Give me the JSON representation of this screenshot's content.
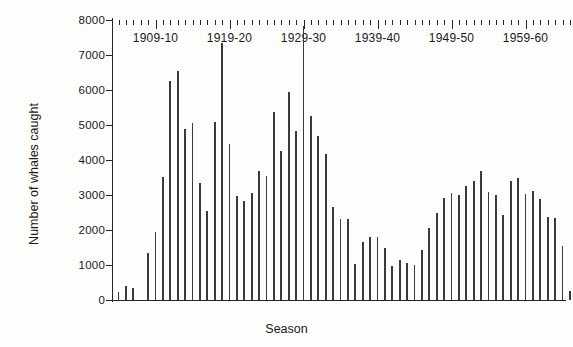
{
  "chart_data": {
    "type": "bar",
    "title": "",
    "xlabel": "Season",
    "ylabel": "Number of whales caught",
    "ylim": [
      0,
      8000
    ],
    "ytick_labels": [
      "0",
      "1000",
      "2000",
      "3000",
      "4000",
      "5000",
      "6000",
      "7000",
      "8000"
    ],
    "ytick_values": [
      0,
      1000,
      2000,
      3000,
      4000,
      5000,
      6000,
      7000,
      8000
    ],
    "xtick_labels": [
      "1909-10",
      "1919-20",
      "1929-30",
      "1939-40",
      "1949-50",
      "1959-60"
    ],
    "xtick_values": [
      "1909-10",
      "1919-20",
      "1929-30",
      "1939-40",
      "1949-50",
      "1959-60"
    ],
    "grid": false,
    "legend": "none",
    "x_start": "1904-05",
    "categories": [
      "1904-05",
      "1905-06",
      "1906-07",
      "1907-08",
      "1908-09",
      "1909-10",
      "1910-11",
      "1911-12",
      "1912-13",
      "1913-14",
      "1914-15",
      "1915-16",
      "1916-17",
      "1917-18",
      "1918-19",
      "1919-20",
      "1920-21",
      "1921-22",
      "1922-23",
      "1923-24",
      "1924-25",
      "1925-26",
      "1926-27",
      "1927-28",
      "1928-29",
      "1929-30",
      "1930-31",
      "1931-32",
      "1932-33",
      "1933-34",
      "1934-35",
      "1935-36",
      "1936-37",
      "1937-38",
      "1938-39",
      "1939-40",
      "1940-41",
      "1941-42",
      "1942-43",
      "1943-44",
      "1944-45",
      "1945-46",
      "1946-47",
      "1947-48",
      "1948-49",
      "1949-50",
      "1950-51",
      "1951-52",
      "1952-53",
      "1953-54",
      "1954-55",
      "1955-56",
      "1956-57",
      "1957-58",
      "1958-59",
      "1959-60",
      "1960-61",
      "1961-62",
      "1962-63",
      "1963-64",
      "1964-65",
      "1965-66"
    ],
    "values": [
      220,
      400,
      330,
      0,
      1350,
      1950,
      3520,
      6250,
      6540,
      4880,
      5060,
      3340,
      2540,
      5080,
      7340,
      4450,
      2980,
      2820,
      3060,
      3700,
      3550,
      5380,
      4250,
      5950,
      4840,
      7840,
      5250,
      4680,
      4170,
      2650,
      2320,
      2320,
      1020,
      1670,
      1800,
      1790,
      1480,
      960,
      1130,
      1070,
      1000,
      1430,
      2050,
      2480,
      2920,
      3070,
      3000,
      3270,
      3400,
      3700,
      3100,
      3000,
      2430,
      3390,
      3480,
      3020,
      3120,
      2880,
      2380,
      2330,
      1530,
      250
    ],
    "bar_color": "#3a3a3a"
  }
}
